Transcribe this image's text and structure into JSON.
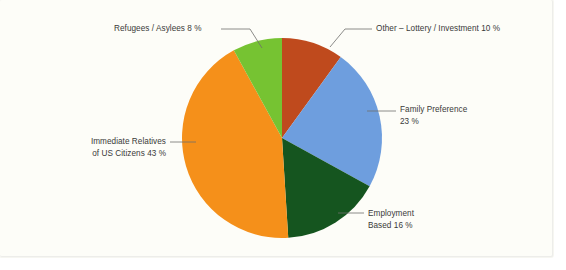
{
  "chart_data": {
    "type": "pie",
    "title": "",
    "subtitle": "",
    "xlabel": "",
    "ylabel": "",
    "legend_position": "none",
    "grid": false,
    "unit": "%",
    "total": 100,
    "start_angle_deg": 0,
    "direction": "clockwise",
    "categories": [
      "Other – Lottery / Investment",
      "Family Preference",
      "Employment Based",
      "Immediate Relatives of US Citizens",
      "Refugees / Asylees"
    ],
    "values": [
      10,
      23,
      16,
      43,
      8
    ],
    "colors": [
      "#bf4a1d",
      "#6e9ede",
      "#15551f",
      "#f5901a",
      "#76c332"
    ],
    "slices": [
      {
        "name": "other-lottery-investment",
        "label_lines": [
          "Other – Lottery / Investment 10 %"
        ],
        "value": 10,
        "value_text": "10 %",
        "color": "#bf4a1d",
        "start_deg": 0,
        "end_deg": 36
      },
      {
        "name": "family-preference",
        "label_lines": [
          "Family Preference",
          "23 %"
        ],
        "value": 23,
        "value_text": "23 %",
        "color": "#6e9ede",
        "start_deg": 36,
        "end_deg": 118.8
      },
      {
        "name": "employment-based",
        "label_lines": [
          "Employment",
          "Based 16 %"
        ],
        "value": 16,
        "value_text": "16 %",
        "color": "#15551f",
        "start_deg": 118.8,
        "end_deg": 176.4
      },
      {
        "name": "immediate-relatives",
        "label_lines": [
          "Immediate Relatives",
          "of US Citizens 43 %"
        ],
        "value": 43,
        "value_text": "43 %",
        "color": "#f5901a",
        "start_deg": 176.4,
        "end_deg": 331.2
      },
      {
        "name": "refugees-asylees",
        "label_lines": [
          "Refugees / Asylees 8 %"
        ],
        "value": 8,
        "value_text": "8 %",
        "color": "#76c332",
        "start_deg": 331.2,
        "end_deg": 360
      }
    ]
  },
  "labels": {
    "refugees": "Refugees / Asylees 8 %",
    "other": "Other – Lottery / Investment 10 %",
    "family_l1": "Family Preference",
    "family_l2": "23 %",
    "employment_l1": "Employment",
    "employment_l2": "Based 16 %",
    "immediate_l1": "Immediate Relatives",
    "immediate_l2": "of US Citizens 43 %"
  },
  "style": {
    "background": "#fdfdf8",
    "page_background": "#ffffff",
    "text_color": "#3a3a38",
    "leader_color": "#6e6e6c"
  }
}
